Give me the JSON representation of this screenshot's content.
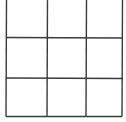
{
  "board": {
    "rows": 3,
    "cols": 3,
    "line_color": "#3a3a3a",
    "background": "#ffffff",
    "cells": [
      [
        "",
        "",
        ""
      ],
      [
        "",
        "",
        ""
      ],
      [
        "",
        "",
        ""
      ]
    ]
  }
}
